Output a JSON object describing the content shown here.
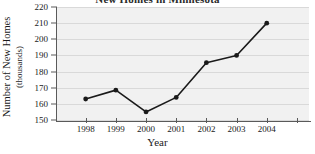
{
  "chart_data": {
    "type": "line",
    "title": "New Homes in Minnesota",
    "title_clipped": true,
    "xlabel": "Year",
    "ylabel": "Number of New Homes (thousands)",
    "ylabel_line1": "Number of New Homes",
    "ylabel_line2": "(thousands)",
    "categories": [
      "1998",
      "1999",
      "2000",
      "2001",
      "2002",
      "2003",
      "2004"
    ],
    "values": [
      163,
      168.5,
      155,
      164,
      185.5,
      190,
      210
    ],
    "ylim": [
      150,
      220
    ],
    "yticks": [
      150,
      160,
      170,
      180,
      190,
      200,
      210,
      220
    ],
    "grid": true,
    "legend": "none",
    "series_color": "#1a1a1a",
    "marker": "filled-circle",
    "plot_background": "#f1f1f1",
    "gridline_color": "#d9d9d9",
    "axis_color": "#5a5a5a"
  }
}
